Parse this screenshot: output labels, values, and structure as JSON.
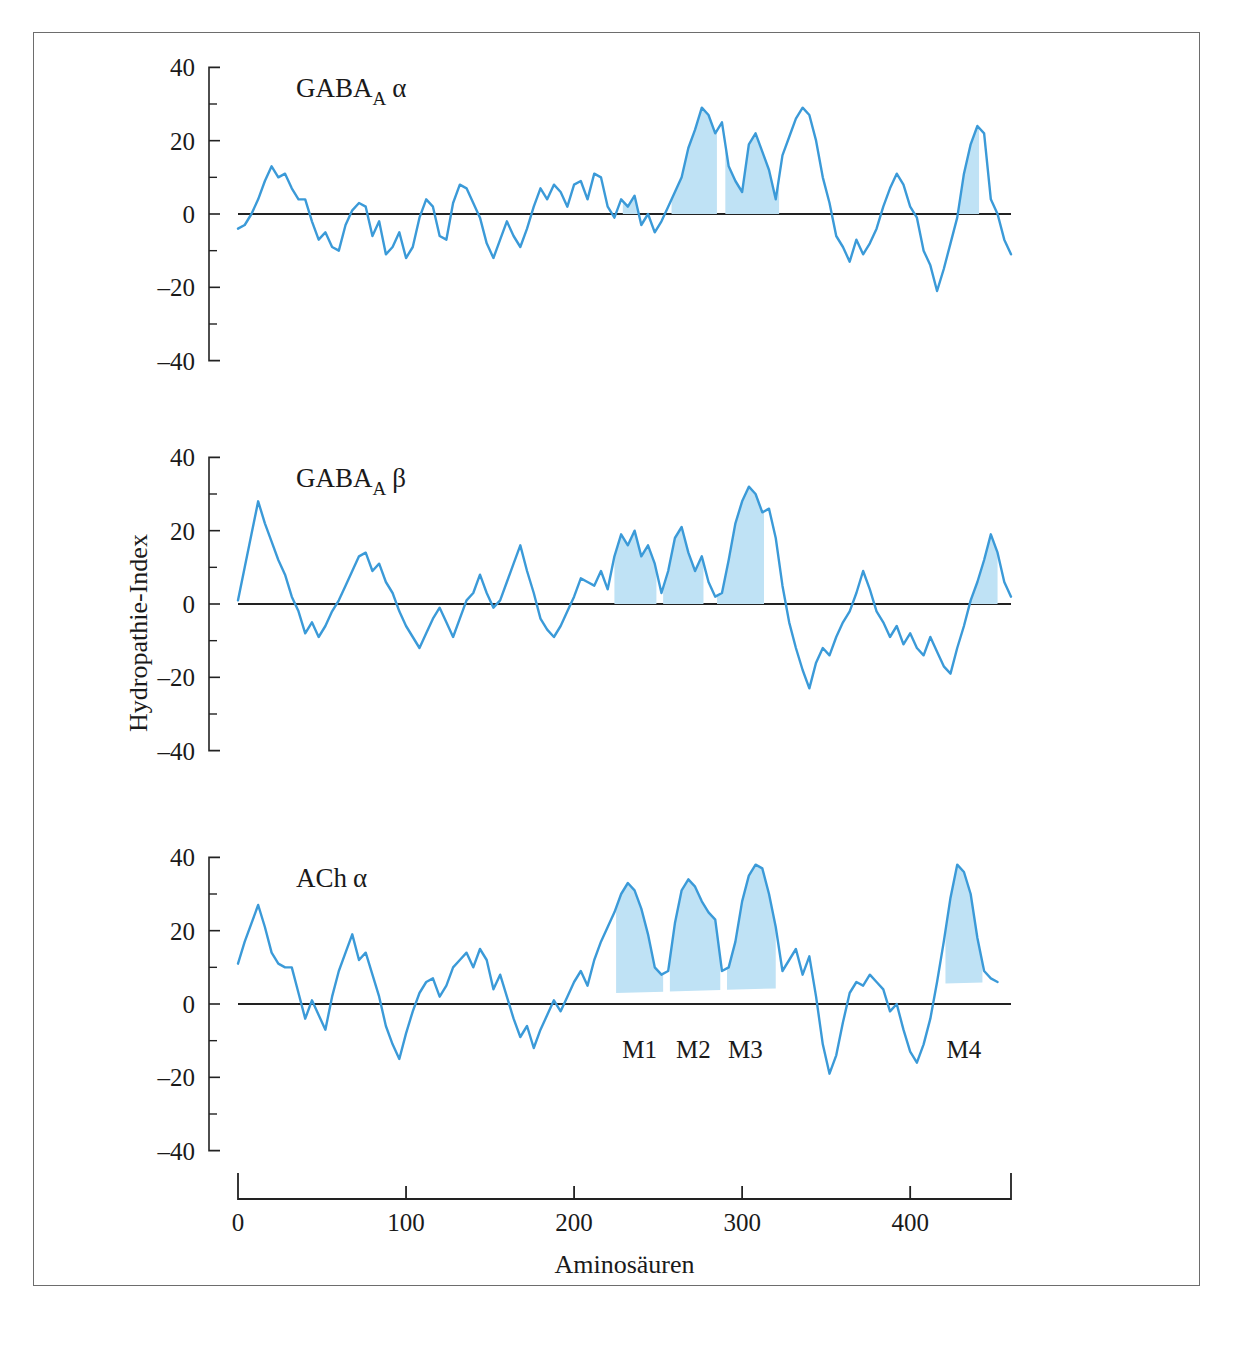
{
  "figure": {
    "y_axis_label": "Hydropathie-Index",
    "x_axis_label": "Aminosäuren",
    "colors": {
      "line": "#3b9ad8",
      "fill": "#bfe2f5",
      "axis": "#222222",
      "frame": "#6d6d6d"
    },
    "caption_partial": ""
  },
  "chart_data": [
    {
      "type": "line",
      "title": "GABA_A α",
      "title_parts": {
        "base": "GABA",
        "sub": "A",
        "greek": "α"
      },
      "xlabel": "Aminosäuren",
      "ylabel": "Hydropathie-Index",
      "xlim": [
        0,
        460
      ],
      "ylim": [
        -45,
        45
      ],
      "yticks": [
        -40,
        -20,
        0,
        20,
        40
      ],
      "ytick_minor": [
        -30,
        -10,
        10,
        30
      ],
      "xticks": [
        0,
        100,
        200,
        300,
        400
      ],
      "grid": false,
      "legend": "none",
      "shaded_segments": [
        {
          "name": "M1",
          "x_start": 229,
          "x_end": 253
        },
        {
          "name": "M2",
          "x_start": 258,
          "x_end": 285
        },
        {
          "name": "M3",
          "x_start": 290,
          "x_end": 322
        },
        {
          "name": "M4",
          "x_start": 423,
          "x_end": 441
        }
      ],
      "x": [
        0,
        4,
        8,
        12,
        16,
        20,
        24,
        28,
        32,
        36,
        40,
        44,
        48,
        52,
        56,
        60,
        64,
        68,
        72,
        76,
        80,
        84,
        88,
        92,
        96,
        100,
        104,
        108,
        112,
        116,
        120,
        124,
        128,
        132,
        136,
        140,
        144,
        148,
        152,
        156,
        160,
        164,
        168,
        172,
        176,
        180,
        184,
        188,
        192,
        196,
        200,
        204,
        208,
        212,
        216,
        220,
        224,
        228,
        232,
        236,
        240,
        244,
        248,
        252,
        256,
        260,
        264,
        268,
        272,
        276,
        280,
        284,
        288,
        292,
        296,
        300,
        304,
        308,
        312,
        316,
        320,
        324,
        328,
        332,
        336,
        340,
        344,
        348,
        352,
        356,
        360,
        364,
        368,
        372,
        376,
        380,
        384,
        388,
        392,
        396,
        400,
        404,
        408,
        412,
        416,
        420,
        424,
        428,
        432,
        436,
        440,
        444,
        448,
        452,
        456,
        460
      ],
      "y": [
        -4,
        -3,
        0,
        4,
        9,
        13,
        10,
        11,
        7,
        4,
        4,
        -2,
        -7,
        -5,
        -9,
        -10,
        -3,
        1,
        3,
        2,
        -6,
        -2,
        -11,
        -9,
        -5,
        -12,
        -9,
        -1,
        4,
        2,
        -6,
        -7,
        3,
        8,
        7,
        3,
        -1,
        -8,
        -12,
        -7,
        -2,
        -6,
        -9,
        -4,
        2,
        7,
        4,
        8,
        6,
        2,
        8,
        9,
        4,
        11,
        10,
        2,
        -1,
        4,
        2,
        5,
        -3,
        0,
        -5,
        -2,
        2,
        6,
        10,
        18,
        23,
        29,
        27,
        22,
        25,
        13,
        9,
        6,
        19,
        22,
        17,
        12,
        4,
        16,
        21,
        26,
        29,
        27,
        20,
        10,
        3,
        -6,
        -9,
        -13,
        -7,
        -11,
        -8,
        -4,
        2,
        7,
        11,
        8,
        2,
        -1,
        -10,
        -14,
        -21,
        -15,
        -8,
        -1,
        11,
        19,
        24,
        22,
        4,
        0,
        -7,
        -11
      ]
    },
    {
      "type": "line",
      "title": "GABA_A β",
      "title_parts": {
        "base": "GABA",
        "sub": "A",
        "greek": "β"
      },
      "xlabel": "Aminosäuren",
      "ylabel": "Hydropathie-Index",
      "xlim": [
        0,
        460
      ],
      "ylim": [
        -45,
        45
      ],
      "yticks": [
        -40,
        -20,
        0,
        20,
        40
      ],
      "ytick_minor": [
        -30,
        -10,
        10,
        30
      ],
      "xticks": [
        0,
        100,
        200,
        300,
        400
      ],
      "grid": false,
      "legend": "none",
      "shaded_segments": [
        {
          "name": "M1",
          "x_start": 224,
          "x_end": 249
        },
        {
          "name": "M2",
          "x_start": 253,
          "x_end": 277
        },
        {
          "name": "M3",
          "x_start": 285,
          "x_end": 313
        },
        {
          "name": "M4",
          "x_start": 430,
          "x_end": 452
        }
      ],
      "x": [
        0,
        4,
        8,
        12,
        16,
        20,
        24,
        28,
        32,
        36,
        40,
        44,
        48,
        52,
        56,
        60,
        64,
        68,
        72,
        76,
        80,
        84,
        88,
        92,
        96,
        100,
        104,
        108,
        112,
        116,
        120,
        124,
        128,
        132,
        136,
        140,
        144,
        148,
        152,
        156,
        160,
        164,
        168,
        172,
        176,
        180,
        184,
        188,
        192,
        196,
        200,
        204,
        208,
        212,
        216,
        220,
        224,
        228,
        232,
        236,
        240,
        244,
        248,
        252,
        256,
        260,
        264,
        268,
        272,
        276,
        280,
        284,
        288,
        292,
        296,
        300,
        304,
        308,
        312,
        316,
        320,
        324,
        328,
        332,
        336,
        340,
        344,
        348,
        352,
        356,
        360,
        364,
        368,
        372,
        376,
        380,
        384,
        388,
        392,
        396,
        400,
        404,
        408,
        412,
        416,
        420,
        424,
        428,
        432,
        436,
        440,
        444,
        448,
        452,
        456,
        460
      ],
      "y": [
        1,
        10,
        19,
        28,
        22,
        17,
        12,
        8,
        2,
        -2,
        -8,
        -5,
        -9,
        -6,
        -2,
        1,
        5,
        9,
        13,
        14,
        9,
        11,
        6,
        3,
        -2,
        -6,
        -9,
        -12,
        -8,
        -4,
        -1,
        -5,
        -9,
        -4,
        1,
        3,
        8,
        3,
        -1,
        1,
        6,
        11,
        16,
        9,
        3,
        -4,
        -7,
        -9,
        -6,
        -2,
        2,
        7,
        6,
        5,
        9,
        4,
        13,
        19,
        16,
        20,
        13,
        16,
        11,
        3,
        9,
        18,
        21,
        14,
        9,
        13,
        6,
        2,
        3,
        12,
        22,
        28,
        32,
        30,
        25,
        26,
        18,
        5,
        -5,
        -12,
        -18,
        -23,
        -16,
        -12,
        -14,
        -9,
        -5,
        -2,
        3,
        9,
        4,
        -2,
        -5,
        -9,
        -6,
        -11,
        -8,
        -12,
        -14,
        -9,
        -13,
        -17,
        -19,
        -12,
        -6,
        1,
        6,
        12,
        19,
        14,
        6,
        2,
        2
      ]
    },
    {
      "type": "line",
      "title": "AChα",
      "title_parts": {
        "base": "ACh",
        "sub": "",
        "greek": "α"
      },
      "xlabel": "Aminosäuren",
      "ylabel": "Hydropathie-Index",
      "xlim": [
        0,
        460
      ],
      "ylim": [
        -45,
        45
      ],
      "yticks": [
        -40,
        -20,
        0,
        20,
        40
      ],
      "ytick_minor": [
        -30,
        -10,
        10,
        30
      ],
      "xticks": [
        0,
        100,
        200,
        300,
        400
      ],
      "grid": false,
      "legend": "none",
      "segment_labels": [
        {
          "name": "M1",
          "x": 239
        },
        {
          "name": "M2",
          "x": 271
        },
        {
          "name": "M3",
          "x": 302
        },
        {
          "name": "M4",
          "x": 432
        }
      ],
      "shaded_segments": [
        {
          "name": "M1",
          "x_start": 225,
          "x_end": 253
        },
        {
          "name": "M2",
          "x_start": 257,
          "x_end": 287
        },
        {
          "name": "M3",
          "x_start": 291,
          "x_end": 320
        },
        {
          "name": "M4",
          "x_start": 421,
          "x_end": 443
        }
      ],
      "x": [
        0,
        4,
        8,
        12,
        16,
        20,
        24,
        28,
        32,
        36,
        40,
        44,
        48,
        52,
        56,
        60,
        64,
        68,
        72,
        76,
        80,
        84,
        88,
        92,
        96,
        100,
        104,
        108,
        112,
        116,
        120,
        124,
        128,
        132,
        136,
        140,
        144,
        148,
        152,
        156,
        160,
        164,
        168,
        172,
        176,
        180,
        184,
        188,
        192,
        196,
        200,
        204,
        208,
        212,
        216,
        220,
        224,
        228,
        232,
        236,
        240,
        244,
        248,
        252,
        256,
        260,
        264,
        268,
        272,
        276,
        280,
        284,
        288,
        292,
        296,
        300,
        304,
        308,
        312,
        316,
        320,
        324,
        328,
        332,
        336,
        340,
        344,
        348,
        352,
        356,
        360,
        364,
        368,
        372,
        376,
        380,
        384,
        388,
        392,
        396,
        400,
        404,
        408,
        412,
        416,
        420,
        424,
        428,
        432,
        436,
        440,
        444,
        448,
        452,
        456,
        460
      ],
      "y": [
        11,
        17,
        22,
        27,
        21,
        14,
        11,
        10,
        10,
        3,
        -4,
        1,
        -3,
        -7,
        2,
        9,
        14,
        19,
        12,
        14,
        8,
        2,
        -6,
        -11,
        -15,
        -8,
        -2,
        3,
        6,
        7,
        2,
        5,
        10,
        12,
        14,
        10,
        15,
        12,
        4,
        8,
        2,
        -4,
        -9,
        -6,
        -12,
        -7,
        -3,
        1,
        -2,
        2,
        6,
        9,
        5,
        12,
        17,
        21,
        25,
        30,
        33,
        31,
        26,
        19,
        10,
        8,
        9,
        22,
        31,
        34,
        32,
        28,
        25,
        23,
        9,
        10,
        17,
        28,
        35,
        38,
        37,
        30,
        21,
        9,
        12,
        15,
        8,
        13,
        2,
        -11,
        -19,
        -14,
        -5,
        3,
        6,
        5,
        8,
        6,
        4,
        -2,
        0,
        -7,
        -13,
        -16,
        -11,
        -4,
        6,
        17,
        29,
        38,
        36,
        30,
        18,
        9,
        7,
        6
      ]
    }
  ]
}
